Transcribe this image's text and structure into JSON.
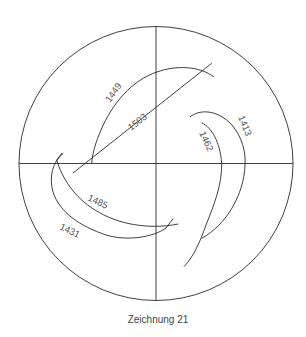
{
  "figure": {
    "caption": "Zeichnung 21",
    "circle": {
      "cx": 156,
      "cy": 163.5,
      "r": 137
    },
    "axes": {
      "horizontal": true,
      "vertical": true
    },
    "curves": [
      {
        "label": "1449",
        "type": "arc"
      },
      {
        "label": "1503",
        "type": "line"
      },
      {
        "label": "1413",
        "type": "arc"
      },
      {
        "label": "1462",
        "type": "arc"
      },
      {
        "label": "1485",
        "type": "arc"
      },
      {
        "label": "1431",
        "type": "arc"
      }
    ]
  }
}
